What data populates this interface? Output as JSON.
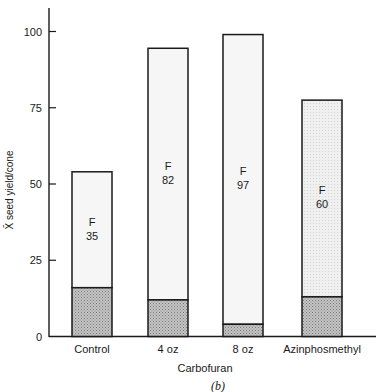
{
  "chart_data": {
    "type": "bar",
    "stacked": true,
    "title": "",
    "caption": "(b)",
    "xlabel": "Carbofuran",
    "ylabel": "X̄ seed yield/cone",
    "ylim": [
      0,
      108
    ],
    "yticks": [
      0,
      25,
      50,
      75,
      100
    ],
    "grid": false,
    "categories": [
      "Control",
      "4 oz",
      "8 oz",
      "Azinphosmethyl"
    ],
    "series": [
      {
        "name": "lower (shaded)",
        "values": [
          16,
          12,
          4,
          13
        ]
      },
      {
        "name": "upper",
        "values": [
          38,
          82.5,
          95,
          64.5
        ]
      }
    ],
    "totals": [
      54,
      94.5,
      99,
      77.5
    ],
    "annotations": [
      {
        "category": "Control",
        "text": "F\n35",
        "line1": "F",
        "line2": "35"
      },
      {
        "category": "4 oz",
        "text": "F\n82",
        "line1": "F",
        "line2": "82"
      },
      {
        "category": "8 oz",
        "text": "F\n97",
        "line1": "F",
        "line2": "97"
      },
      {
        "category": "Azinphosmethyl",
        "text": "F\n60",
        "line1": "F",
        "line2": "60"
      }
    ],
    "colors": {
      "upper_fill": "#f6f6f6",
      "upper_fill_azin": "#ececec",
      "lower_fill": "#b8b8b8",
      "stroke": "#1a1a1a"
    }
  }
}
